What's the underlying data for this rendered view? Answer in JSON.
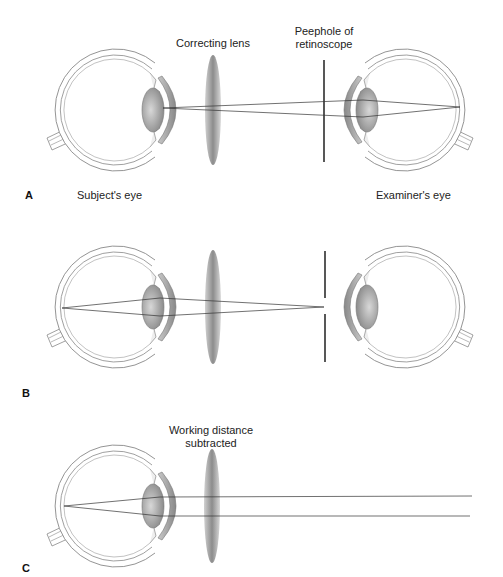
{
  "figure": {
    "panels": [
      {
        "letter": "A",
        "labels": {
          "correcting_lens": "Correcting lens",
          "peephole_line1": "Peephole of",
          "peephole_line2": "retinoscope",
          "subject_eye": "Subject's eye",
          "examiner_eye": "Examiner's eye"
        }
      },
      {
        "letter": "B"
      },
      {
        "letter": "C",
        "labels": {
          "working_distance_line1": "Working distance",
          "working_distance_line2": "subtracted"
        }
      }
    ],
    "colors": {
      "outline": "#888888",
      "ray": "#333333",
      "retinoscope": "#111111",
      "lens_fill": "#9a9a9a"
    }
  }
}
